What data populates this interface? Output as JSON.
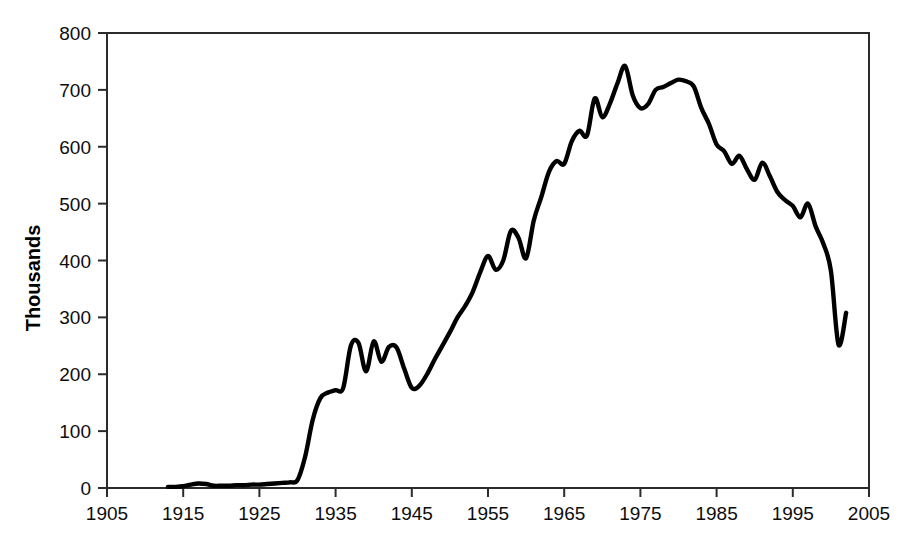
{
  "chart_data": {
    "type": "line",
    "title": "",
    "xlabel": "",
    "ylabel": "Thousands",
    "xlim": [
      1905,
      2005
    ],
    "ylim": [
      0,
      800
    ],
    "xticks": [
      1905,
      1915,
      1925,
      1935,
      1945,
      1955,
      1965,
      1975,
      1985,
      1995,
      2005
    ],
    "yticks": [
      0,
      100,
      200,
      300,
      400,
      500,
      600,
      700,
      800
    ],
    "xtick_labels": [
      "1905",
      "1915",
      "1925",
      "1935",
      "1945",
      "1955",
      "1965",
      "1975",
      "1985",
      "1995",
      "2005"
    ],
    "ytick_labels": [
      "0",
      "100",
      "200",
      "300",
      "400",
      "500",
      "600",
      "700",
      "800"
    ],
    "grid": false,
    "legend": false,
    "series": [
      {
        "name": "Value",
        "color": "#000000",
        "x": [
          1913,
          1914,
          1915,
          1916,
          1917,
          1918,
          1919,
          1920,
          1921,
          1922,
          1923,
          1924,
          1925,
          1926,
          1927,
          1928,
          1929,
          1930,
          1931,
          1932,
          1933,
          1934,
          1935,
          1936,
          1937,
          1938,
          1939,
          1940,
          1941,
          1942,
          1943,
          1944,
          1945,
          1946,
          1947,
          1948,
          1949,
          1950,
          1951,
          1952,
          1953,
          1954,
          1955,
          1956,
          1957,
          1958,
          1959,
          1960,
          1961,
          1962,
          1963,
          1964,
          1965,
          1966,
          1967,
          1968,
          1969,
          1970,
          1971,
          1972,
          1973,
          1974,
          1975,
          1976,
          1977,
          1978,
          1979,
          1980,
          1981,
          1982,
          1983,
          1984,
          1985,
          1986,
          1987,
          1988,
          1989,
          1990,
          1991,
          1992,
          1993,
          1994,
          1995,
          1996,
          1997,
          1998,
          1999,
          2000,
          2001,
          2002
        ],
        "y": [
          2,
          2,
          3,
          6,
          8,
          7,
          4,
          4,
          4,
          5,
          5,
          6,
          6,
          7,
          8,
          9,
          10,
          14,
          55,
          120,
          158,
          168,
          172,
          176,
          250,
          255,
          205,
          258,
          222,
          248,
          247,
          210,
          176,
          180,
          200,
          226,
          250,
          274,
          300,
          320,
          345,
          380,
          408,
          384,
          400,
          452,
          440,
          404,
          470,
          512,
          556,
          575,
          570,
          610,
          628,
          620,
          685,
          652,
          676,
          712,
          742,
          690,
          668,
          675,
          700,
          705,
          712,
          718,
          715,
          706,
          668,
          640,
          604,
          592,
          570,
          584,
          560,
          542,
          572,
          548,
          520,
          506,
          496,
          476,
          500,
          460,
          430,
          382,
          252,
          308
        ]
      }
    ]
  },
  "axis": {
    "y_title": "Thousands"
  }
}
